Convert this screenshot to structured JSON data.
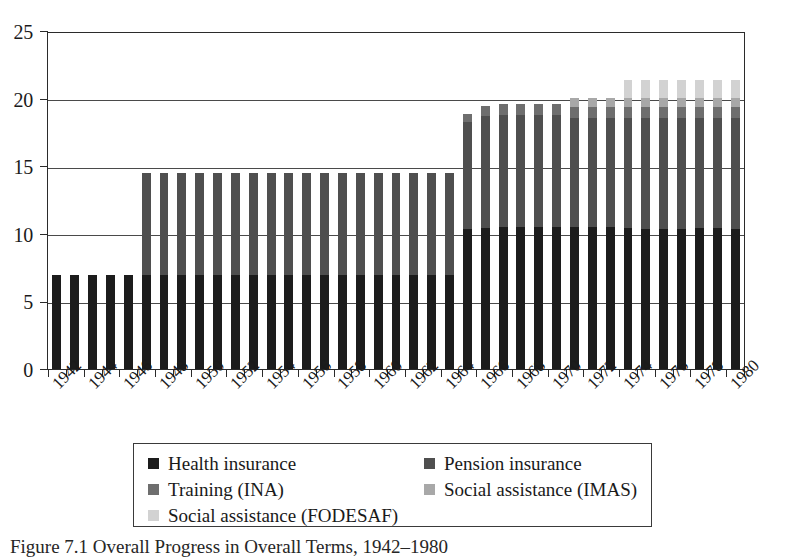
{
  "figure": {
    "caption": "Figure 7.1 Overall Progress in Overall Terms, 1942–1980"
  },
  "axes": {
    "y_ticks": [
      "0",
      "5",
      "10",
      "15",
      "20",
      "25"
    ],
    "x_ticks": [
      "1942",
      "1944",
      "1946",
      "1948",
      "1950",
      "1952",
      "1954",
      "1956",
      "1958",
      "1960",
      "1962",
      "1964",
      "1966",
      "1968",
      "1970",
      "1972",
      "1974",
      "1976",
      "1978",
      "1980"
    ]
  },
  "legend": {
    "items": [
      {
        "label": "Health insurance",
        "color": "#1c1c1c"
      },
      {
        "label": "Pension insurance",
        "color": "#4f4f4f"
      },
      {
        "label": "Training (INA)",
        "color": "#6e6e6e"
      },
      {
        "label": "Social assistance (IMAS)",
        "color": "#a8a8a8"
      },
      {
        "label": "Social assistance (FODESAF)",
        "color": "#d2d2d2"
      }
    ]
  },
  "chart_data": {
    "type": "bar",
    "stacked": true,
    "title": "Figure 7.1 Overall Progress in Overall Terms, 1942–1980",
    "xlabel": "",
    "ylabel": "",
    "ylim": [
      0,
      25
    ],
    "ytick_step": 5,
    "grid": true,
    "legend_position": "bottom",
    "categories": [
      1942,
      1943,
      1944,
      1945,
      1946,
      1947,
      1948,
      1949,
      1950,
      1951,
      1952,
      1953,
      1954,
      1955,
      1956,
      1957,
      1958,
      1959,
      1960,
      1961,
      1962,
      1963,
      1964,
      1965,
      1966,
      1967,
      1968,
      1969,
      1970,
      1971,
      1972,
      1973,
      1974,
      1975,
      1976,
      1977,
      1978,
      1979,
      1980
    ],
    "series": [
      {
        "name": "Health insurance",
        "color": "#1c1c1c",
        "values": [
          7.0,
          7.0,
          7.0,
          7.0,
          7.0,
          7.0,
          7.0,
          7.0,
          7.0,
          7.0,
          7.0,
          7.0,
          7.0,
          7.0,
          7.0,
          7.0,
          7.0,
          7.0,
          7.0,
          7.0,
          7.0,
          7.0,
          7.0,
          10.4,
          10.5,
          10.6,
          10.6,
          10.6,
          10.6,
          10.6,
          10.6,
          10.6,
          10.5,
          10.4,
          10.4,
          10.4,
          10.5,
          10.5,
          10.4
        ]
      },
      {
        "name": "Pension insurance",
        "color": "#4f4f4f",
        "values": [
          0,
          0,
          0,
          0,
          0,
          7.6,
          7.6,
          7.6,
          7.6,
          7.6,
          7.6,
          7.6,
          7.6,
          7.6,
          7.6,
          7.6,
          7.6,
          7.6,
          7.6,
          7.6,
          7.6,
          7.6,
          7.6,
          8.0,
          8.3,
          8.3,
          8.3,
          8.3,
          8.3,
          8.1,
          8.1,
          8.1,
          8.2,
          8.3,
          8.3,
          8.3,
          8.2,
          8.2,
          8.3
        ]
      },
      {
        "name": "Training (INA)",
        "color": "#6e6e6e",
        "values": [
          0,
          0,
          0,
          0,
          0,
          0,
          0,
          0,
          0,
          0,
          0,
          0,
          0,
          0,
          0,
          0,
          0,
          0,
          0,
          0,
          0,
          0,
          0,
          0.6,
          0.8,
          0.8,
          0.8,
          0.8,
          0.8,
          0.8,
          0.8,
          0.8,
          0.8,
          0.8,
          0.8,
          0.8,
          0.8,
          0.8,
          0.8
        ]
      },
      {
        "name": "Social assistance (IMAS)",
        "color": "#a8a8a8",
        "values": [
          0,
          0,
          0,
          0,
          0,
          0,
          0,
          0,
          0,
          0,
          0,
          0,
          0,
          0,
          0,
          0,
          0,
          0,
          0,
          0,
          0,
          0,
          0,
          0,
          0,
          0,
          0,
          0,
          0,
          0.7,
          0.7,
          0.7,
          0.7,
          0.7,
          0.7,
          0.7,
          0.7,
          0.7,
          0.7
        ]
      },
      {
        "name": "Social assistance (FODESAF)",
        "color": "#d2d2d2",
        "values": [
          0,
          0,
          0,
          0,
          0,
          0,
          0,
          0,
          0,
          0,
          0,
          0,
          0,
          0,
          0,
          0,
          0,
          0,
          0,
          0,
          0,
          0,
          0,
          0,
          0,
          0,
          0,
          0,
          0,
          0,
          0,
          0,
          1.3,
          1.3,
          1.3,
          1.3,
          1.3,
          1.3,
          1.3
        ]
      }
    ],
    "totals": [
      7.0,
      7.0,
      7.0,
      7.0,
      7.0,
      14.6,
      14.6,
      14.6,
      14.6,
      14.6,
      14.6,
      14.6,
      14.6,
      14.6,
      14.6,
      14.6,
      14.6,
      14.6,
      14.6,
      14.6,
      14.6,
      14.6,
      14.6,
      19.0,
      19.6,
      19.7,
      19.7,
      19.7,
      19.7,
      20.2,
      20.2,
      20.2,
      21.5,
      21.5,
      21.5,
      21.5,
      21.5,
      21.5,
      21.5
    ]
  }
}
